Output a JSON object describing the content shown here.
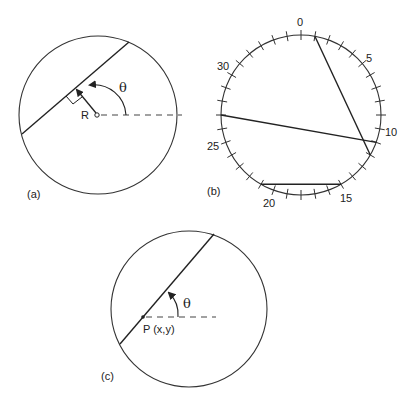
{
  "figure": {
    "panels": [
      {
        "id": "a",
        "label": "(a)",
        "circle": {
          "cx": 98,
          "cy": 115,
          "r": 79
        },
        "line": {
          "x1": 22,
          "y1": 134,
          "x2": 129,
          "y2": 42
        },
        "origin": {
          "x": 98,
          "y": 115
        },
        "perpendicular_foot": {
          "x": 74,
          "y": 87
        },
        "reference_dash_end_x": 182,
        "radius_label": "R",
        "angle_label": "θ"
      },
      {
        "id": "b",
        "label": "(b)",
        "circle": {
          "cx": 301,
          "cy": 115,
          "r": 80
        },
        "tick_count": 36,
        "tick_labels": [
          "0",
          "5",
          "10",
          "15",
          "20",
          "25",
          "30"
        ],
        "tick_label_indices": [
          0,
          5,
          10,
          15,
          20,
          25,
          30
        ],
        "chords": [
          {
            "from_tick": 1,
            "to_tick": 12
          },
          {
            "from_tick": 27,
            "to_tick": 11
          },
          {
            "from_tick": 21,
            "to_tick": 15
          }
        ]
      },
      {
        "id": "c",
        "label": "(c)",
        "circle": {
          "cx": 189,
          "cy": 309,
          "r": 78
        },
        "line": {
          "x1": 120,
          "y1": 344,
          "x2": 214,
          "y2": 234
        },
        "point": {
          "x": 143,
          "y": 317
        },
        "point_label": "P (x,y)",
        "reference_dash_end_x": 216,
        "angle_label": "θ"
      }
    ]
  }
}
